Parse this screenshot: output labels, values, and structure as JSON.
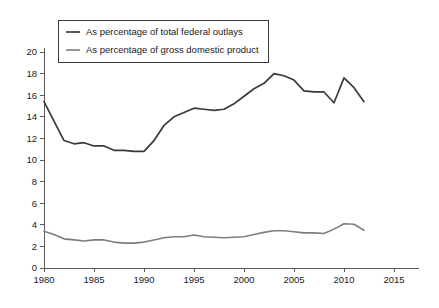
{
  "chart_data": {
    "type": "line",
    "title": "",
    "subtitle": "",
    "xlabel": "",
    "ylabel": "",
    "xlim": [
      1979,
      2017.5
    ],
    "ylim": [
      0,
      20
    ],
    "grid": false,
    "legend_position": "top-left",
    "x_ticks": [
      "1980",
      "1985",
      "1990",
      "1995",
      "2000",
      "2005",
      "2010",
      "2015"
    ],
    "x_tick_values": [
      1980,
      1985,
      1990,
      1995,
      2000,
      2005,
      2010,
      2015
    ],
    "y_ticks": [
      "0",
      "2",
      "4",
      "6",
      "8",
      "10",
      "12",
      "14",
      "16",
      "18",
      "20"
    ],
    "y_tick_values": [
      0,
      2,
      4,
      6,
      8,
      10,
      12,
      14,
      16,
      18,
      20
    ],
    "x": [
      1980,
      1981,
      1982,
      1983,
      1984,
      1985,
      1986,
      1987,
      1988,
      1989,
      1990,
      1991,
      1992,
      1993,
      1994,
      1995,
      1996,
      1997,
      1998,
      1999,
      2000,
      2001,
      2002,
      2003,
      2004,
      2005,
      2006,
      2007,
      2008,
      2009,
      2010,
      2011,
      2012
    ],
    "series": [
      {
        "name": "As percentage of total federal outlays",
        "color": "#3a3a3a",
        "width": 1.7,
        "values": [
          15.4,
          13.6,
          11.8,
          11.5,
          11.6,
          11.3,
          11.3,
          10.9,
          10.9,
          10.8,
          10.8,
          11.8,
          13.2,
          14.0,
          14.4,
          14.8,
          14.7,
          14.6,
          14.7,
          15.2,
          15.9,
          16.6,
          17.1,
          18.0,
          17.8,
          17.4,
          16.4,
          16.3,
          16.3,
          15.3,
          17.6,
          16.7,
          15.4
        ]
      },
      {
        "name": "As percentage of gross domestic product",
        "color": "#7d7d7d",
        "width": 1.6,
        "values": [
          3.4,
          3.1,
          2.7,
          2.6,
          2.5,
          2.6,
          2.6,
          2.4,
          2.3,
          2.3,
          2.4,
          2.6,
          2.8,
          2.9,
          2.9,
          3.05,
          2.9,
          2.85,
          2.8,
          2.85,
          2.9,
          3.1,
          3.3,
          3.45,
          3.45,
          3.35,
          3.25,
          3.25,
          3.2,
          3.6,
          4.1,
          4.05,
          3.5
        ]
      }
    ]
  },
  "legend": {
    "items": [
      {
        "label": "As percentage of total federal outlays"
      },
      {
        "label": "As percentage of gross domestic product"
      }
    ]
  }
}
